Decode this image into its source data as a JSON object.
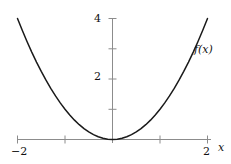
{
  "chart_data": {
    "type": "line",
    "title": "",
    "subtitle": "",
    "xlabel": "x",
    "ylabel": "",
    "curve_label": "f(x)",
    "function": "f(x) = x^2",
    "grid": false,
    "legend": "none",
    "xlim": [
      -2.0,
      2.0
    ],
    "ylim": [
      0.0,
      4.3
    ],
    "x_ticks": [
      -2,
      -1,
      1,
      2
    ],
    "x_tick_labels": [
      "-2",
      "",
      "",
      "2"
    ],
    "y_ticks": [
      1,
      2,
      3,
      4
    ],
    "y_tick_labels": [
      "",
      "2",
      "",
      "4"
    ],
    "x": [
      -2.0,
      -1.9,
      -1.8,
      -1.7,
      -1.6,
      -1.5,
      -1.4,
      -1.3,
      -1.2,
      -1.1,
      -1.0,
      -0.9,
      -0.8,
      -0.7,
      -0.6,
      -0.5,
      -0.4,
      -0.3,
      -0.2,
      -0.1,
      0.0,
      0.1,
      0.2,
      0.3,
      0.4,
      0.5,
      0.6,
      0.7,
      0.8,
      0.9,
      1.0,
      1.1,
      1.2,
      1.3,
      1.4,
      1.5,
      1.6,
      1.7,
      1.8,
      1.9,
      2.0
    ],
    "values": [
      4.0,
      3.61,
      3.24,
      2.89,
      2.56,
      2.25,
      1.96,
      1.69,
      1.44,
      1.21,
      1.0,
      0.81,
      0.64,
      0.49,
      0.36,
      0.25,
      0.16,
      0.09,
      0.04,
      0.01,
      0.0,
      0.01,
      0.04,
      0.09,
      0.16,
      0.25,
      0.36,
      0.49,
      0.64,
      0.81,
      1.0,
      1.21,
      1.44,
      1.69,
      1.96,
      2.25,
      2.56,
      2.89,
      3.24,
      3.61,
      4.0
    ],
    "colors": {
      "curve": "#1a1a1a",
      "axis": "#8c8c8c",
      "tick": "#8c8c8c",
      "text": "#111111",
      "background": "#ffffff"
    }
  },
  "labels": {
    "y_4": "4",
    "y_2": "2",
    "x_neg2": "−2",
    "x_2": "2",
    "axis_x": "x",
    "curve": "f(x)"
  }
}
